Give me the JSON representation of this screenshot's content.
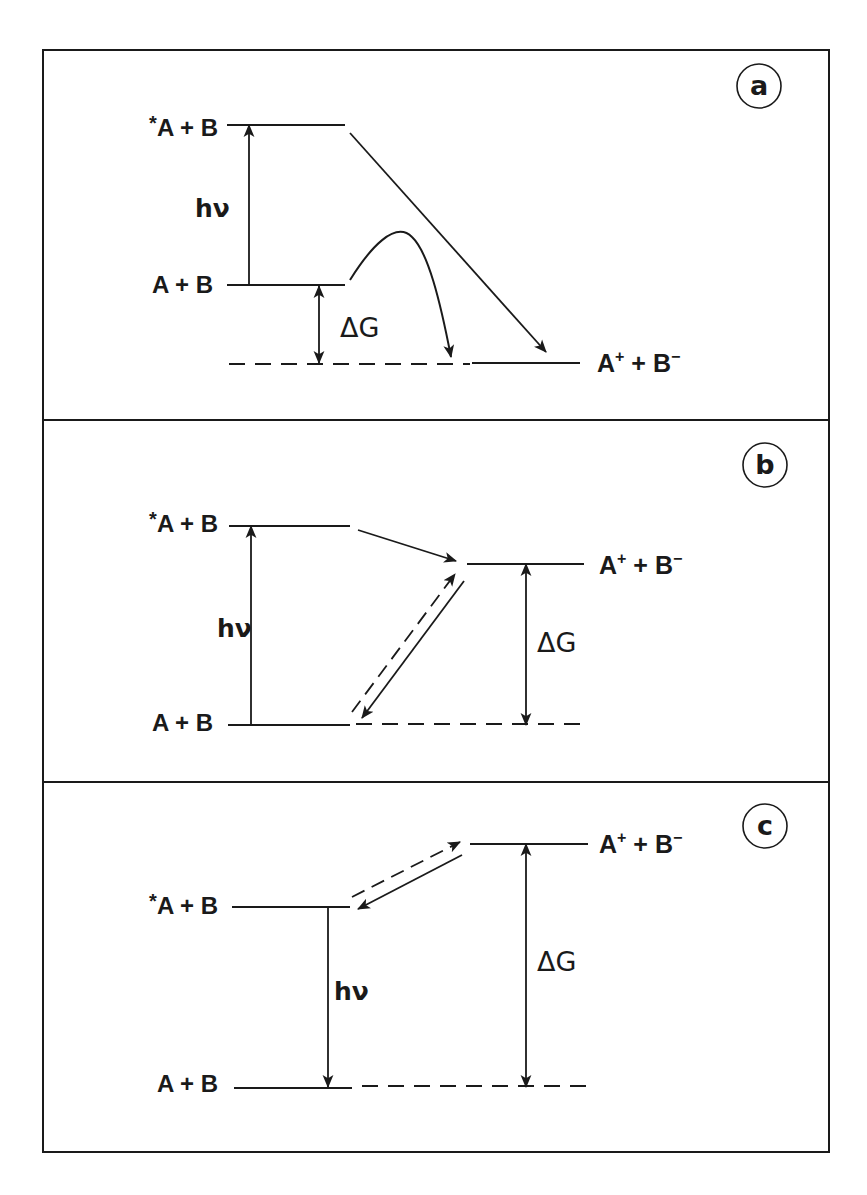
{
  "figure": {
    "colors": {
      "ink": "#1a1a1a",
      "background": "#ffffff"
    },
    "frame": {
      "x": 43,
      "y": 50,
      "width": 786,
      "height": 1102
    },
    "dividers": [
      420,
      782
    ],
    "panels": [
      {
        "id": "a",
        "badge": {
          "label": "a",
          "cx": 759,
          "cy": 86,
          "r": 22
        },
        "levels": [
          {
            "name": "excited-state-level",
            "label": "*A + B",
            "label_parts": [
              "*",
              "A + B"
            ],
            "x1": 227,
            "x2": 345,
            "y": 125,
            "style": "solid",
            "label_x": 218,
            "label_y": 136
          },
          {
            "name": "ground-state-level",
            "label": "A + B",
            "label_parts": [
              "",
              "A + B"
            ],
            "x1": 227,
            "x2": 345,
            "y": 285,
            "style": "solid",
            "label_x": 213,
            "label_y": 293
          },
          {
            "name": "ion-pair-level-dashed",
            "label": "",
            "x1": 229,
            "x2": 470,
            "y": 364,
            "style": "dashed"
          },
          {
            "name": "ion-pair-level",
            "label": "A+ + B-",
            "x1": 472,
            "x2": 580,
            "y": 363,
            "style": "solid",
            "ion_label_x": 597,
            "ion_label_y": 372
          }
        ],
        "arrows": [
          {
            "name": "photon-absorption-arrow",
            "type": "single",
            "x1": 249,
            "y1": 285,
            "x2": 249,
            "y2": 125,
            "label": "hν",
            "label_x": 195,
            "label_y": 217,
            "label_class": "hv"
          },
          {
            "name": "delta-g-arrow",
            "type": "double",
            "x1": 319,
            "y1": 286,
            "x2": 319,
            "y2": 363,
            "label": "ΔG",
            "label_x": 340,
            "label_y": 337,
            "label_class": "dg"
          },
          {
            "name": "direct-electron-transfer-arrow",
            "type": "single",
            "x1": 350,
            "y1": 133,
            "x2": 546,
            "y2": 352
          },
          {
            "name": "activated-electron-transfer-arrow",
            "type": "curve",
            "path": "M350 280 C 370 248, 395 220, 412 237 C 428 252, 440 300, 451 357"
          }
        ]
      },
      {
        "id": "b",
        "badge": {
          "label": "b",
          "cx": 765,
          "cy": 465,
          "r": 22
        },
        "levels": [
          {
            "name": "excited-state-level",
            "label": "*A + B",
            "label_parts": [
              "*",
              "A + B"
            ],
            "x1": 229,
            "x2": 350,
            "y": 526,
            "style": "solid",
            "label_x": 218,
            "label_y": 532
          },
          {
            "name": "ion-pair-level",
            "label": "A+ + B-",
            "x1": 467,
            "x2": 584,
            "y": 564,
            "style": "solid",
            "ion_label_x": 599,
            "ion_label_y": 574
          },
          {
            "name": "ground-state-level",
            "label": "A + B",
            "label_parts": [
              "",
              "A + B"
            ],
            "x1": 228,
            "x2": 350,
            "y": 725,
            "style": "solid",
            "label_x": 213,
            "label_y": 731
          },
          {
            "name": "ground-state-level-dashed",
            "label": "",
            "x1": 356,
            "x2": 584,
            "y": 724,
            "style": "dashed"
          }
        ],
        "arrows": [
          {
            "name": "photon-absorption-arrow",
            "type": "single",
            "x1": 251,
            "y1": 725,
            "x2": 251,
            "y2": 526,
            "label": "hν",
            "label_x": 217,
            "label_y": 637,
            "label_class": "hv"
          },
          {
            "name": "forward-electron-transfer-arrow",
            "type": "single",
            "x1": 358,
            "y1": 530,
            "x2": 456,
            "y2": 561
          },
          {
            "name": "back-electron-transfer-dashed-arrow",
            "type": "single-dashed",
            "x1": 352,
            "y1": 712,
            "x2": 455,
            "y2": 574
          },
          {
            "name": "charge-recombination-arrow",
            "type": "single",
            "x1": 464,
            "y1": 581,
            "x2": 362,
            "y2": 718
          },
          {
            "name": "delta-g-arrow",
            "type": "double",
            "x1": 526,
            "y1": 564,
            "x2": 526,
            "y2": 725,
            "label": "ΔG",
            "label_x": 537,
            "label_y": 652,
            "label_class": "dg"
          }
        ]
      },
      {
        "id": "c",
        "badge": {
          "label": "c",
          "cx": 765,
          "cy": 826,
          "r": 22
        },
        "levels": [
          {
            "name": "ion-pair-level",
            "label": "A+ + B-",
            "x1": 470,
            "x2": 588,
            "y": 844,
            "style": "solid",
            "ion_label_x": 599,
            "ion_label_y": 853
          },
          {
            "name": "excited-state-level",
            "label": "*A + B",
            "label_parts": [
              "*",
              "A + B"
            ],
            "x1": 232,
            "x2": 350,
            "y": 907,
            "style": "solid",
            "label_x": 218,
            "label_y": 914
          },
          {
            "name": "ground-state-level",
            "label": "A + B",
            "label_parts": [
              "",
              "A + B"
            ],
            "x1": 234,
            "x2": 352,
            "y": 1088,
            "style": "solid",
            "label_x": 218,
            "label_y": 1092
          },
          {
            "name": "ground-state-level-dashed",
            "label": "",
            "x1": 362,
            "x2": 590,
            "y": 1086,
            "style": "dashed"
          }
        ],
        "arrows": [
          {
            "name": "photon-emission-arrow",
            "type": "single",
            "x1": 328,
            "y1": 907,
            "x2": 328,
            "y2": 1087,
            "label": "hν",
            "label_x": 334,
            "label_y": 1000,
            "label_class": "hv"
          },
          {
            "name": "forward-electron-transfer-dashed-arrow",
            "type": "single-dashed",
            "x1": 352,
            "y1": 897,
            "x2": 460,
            "y2": 842
          },
          {
            "name": "back-electron-transfer-arrow",
            "type": "single",
            "x1": 462,
            "y1": 855,
            "x2": 358,
            "y2": 909
          },
          {
            "name": "delta-g-arrow",
            "type": "double",
            "x1": 526,
            "y1": 844,
            "x2": 526,
            "y2": 1087,
            "label": "ΔG",
            "label_x": 537,
            "label_y": 971,
            "label_class": "dg"
          }
        ]
      }
    ]
  }
}
